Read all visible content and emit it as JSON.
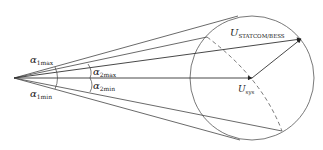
{
  "diagram": {
    "type": "phasor-diagram",
    "origin": [
      14,
      78
    ],
    "circle": {
      "cx": 252,
      "cy": 78,
      "r": 62
    },
    "labels": {
      "alpha1max": {
        "symbol": "α",
        "sub": "1max"
      },
      "alpha1min": {
        "symbol": "α",
        "sub": "1min"
      },
      "alpha2max": {
        "symbol": "α",
        "sub": "2max"
      },
      "alpha2min": {
        "symbol": "α",
        "sub": "2min"
      },
      "u_statcom": {
        "symbol": "U",
        "sub": "STATCOM/BESS"
      },
      "u_sys": {
        "symbol": "U",
        "sub": "sys"
      }
    },
    "colors": {
      "line": "#333333",
      "background": "#ffffff"
    }
  }
}
